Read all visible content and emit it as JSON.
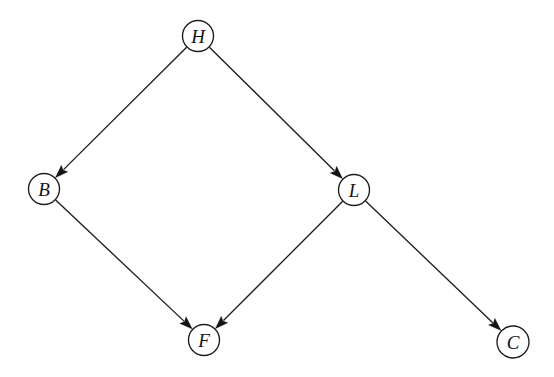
{
  "figure": {
    "kind": "directed-acyclic-graph",
    "background_color": "#ffffff",
    "stroke_color": "#1d1d1d",
    "label_color": "#141414",
    "node_fill": "#ffffff",
    "node_radius": 15.5,
    "width": 554,
    "height": 377
  },
  "nodes": [
    {
      "id": "H",
      "label": "H",
      "cx": 198,
      "cy": 36,
      "r": 15.5
    },
    {
      "id": "B",
      "label": "B",
      "cx": 44,
      "cy": 189,
      "r": 15.5
    },
    {
      "id": "L",
      "label": "L",
      "cx": 354,
      "cy": 190,
      "r": 15.5
    },
    {
      "id": "F",
      "label": "F",
      "cx": 204,
      "cy": 340,
      "r": 15.5
    },
    {
      "id": "C",
      "label": "C",
      "cx": 513,
      "cy": 342,
      "r": 16.0
    }
  ],
  "edges": [
    {
      "id": "H-B",
      "from": "H",
      "to": "B",
      "directed": true
    },
    {
      "id": "H-L",
      "from": "H",
      "to": "L",
      "directed": true
    },
    {
      "id": "B-F",
      "from": "B",
      "to": "F",
      "directed": true
    },
    {
      "id": "L-F",
      "from": "L",
      "to": "F",
      "directed": true
    },
    {
      "id": "L-C",
      "from": "L",
      "to": "C",
      "directed": true
    }
  ],
  "arrow": {
    "length": 13,
    "half_width": 4.6
  }
}
